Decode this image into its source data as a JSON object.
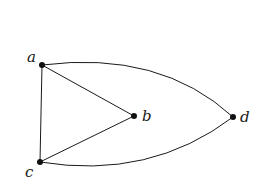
{
  "graph": {
    "vertices": [
      {
        "id": "a",
        "label": "a",
        "x": 42,
        "y": 65,
        "label_x": 27,
        "label_y": 62
      },
      {
        "id": "b",
        "label": "b",
        "x": 134,
        "y": 116,
        "label_x": 142,
        "label_y": 121
      },
      {
        "id": "c",
        "label": "c",
        "x": 40,
        "y": 162,
        "label_x": 25,
        "label_y": 177
      },
      {
        "id": "d",
        "label": "d",
        "x": 233,
        "y": 117,
        "label_x": 240,
        "label_y": 122
      }
    ],
    "edges": [
      {
        "from": "a",
        "to": "c",
        "type": "straight"
      },
      {
        "from": "a",
        "to": "b",
        "type": "straight"
      },
      {
        "from": "b",
        "to": "c",
        "type": "straight"
      },
      {
        "from": "a",
        "to": "d",
        "type": "curved"
      },
      {
        "from": "c",
        "to": "d",
        "type": "curved"
      }
    ],
    "colors": {
      "edge": "#1a1a1a",
      "vertex": "#111111",
      "background": "#ffffff"
    }
  }
}
